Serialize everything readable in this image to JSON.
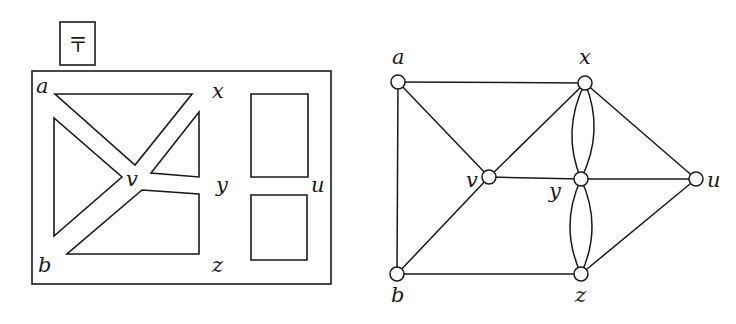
{
  "figure": {
    "left_panel": {
      "description": "Map of regions (faces) inside a bordered rectangle",
      "symbol_box": {
        "glyph": "〒",
        "x": 60,
        "y": 22,
        "w": 35,
        "h": 43
      },
      "border": {
        "x": 32,
        "y": 71,
        "w": 299,
        "h": 213
      },
      "labels": [
        {
          "id": "a",
          "text": "a",
          "x": 36,
          "y": 93
        },
        {
          "id": "x",
          "text": "x",
          "x": 212,
          "y": 98
        },
        {
          "id": "v",
          "text": "v",
          "x": 126,
          "y": 186
        },
        {
          "id": "y",
          "text": "y",
          "x": 216,
          "y": 192
        },
        {
          "id": "u",
          "text": "u",
          "x": 311,
          "y": 192
        },
        {
          "id": "b",
          "text": "b",
          "x": 38,
          "y": 272
        },
        {
          "id": "z",
          "text": "z",
          "x": 212,
          "y": 272
        }
      ],
      "regions": [
        {
          "id": "top-triangle",
          "points": "55,94 192,94 135,165"
        },
        {
          "id": "left-triangle",
          "points": "54,118 54,236 122,177"
        },
        {
          "id": "upper-right-triangle",
          "points": "199,112 199,177 151,173"
        },
        {
          "id": "bottom-quad",
          "points": "142,190 199,194 199,254 67,254"
        },
        {
          "id": "upper-rect",
          "points": "251,94 308,94 308,177 251,177"
        },
        {
          "id": "lower-rect",
          "points": "251,195 307,195 307,260 251,260"
        }
      ]
    },
    "right_panel": {
      "description": "Dual multigraph of the map",
      "nodes": [
        {
          "id": "a",
          "label": "a",
          "x": 398,
          "y": 82,
          "lx": 392,
          "ly": 64
        },
        {
          "id": "x",
          "label": "x",
          "x": 585,
          "y": 83,
          "lx": 579,
          "ly": 64
        },
        {
          "id": "v",
          "label": "v",
          "x": 489,
          "y": 177,
          "lx": 466,
          "ly": 187
        },
        {
          "id": "y",
          "label": "y",
          "x": 581,
          "y": 179,
          "lx": 549,
          "ly": 198
        },
        {
          "id": "u",
          "label": "u",
          "x": 696,
          "y": 179,
          "lx": 707,
          "ly": 187
        },
        {
          "id": "b",
          "label": "b",
          "x": 397,
          "y": 274,
          "lx": 391,
          "ly": 302
        },
        {
          "id": "z",
          "label": "z",
          "x": 581,
          "y": 274,
          "lx": 575,
          "ly": 302
        }
      ],
      "edges": [
        {
          "from": "a",
          "to": "x"
        },
        {
          "from": "a",
          "to": "b"
        },
        {
          "from": "a",
          "to": "v"
        },
        {
          "from": "v",
          "to": "x"
        },
        {
          "from": "v",
          "to": "b"
        },
        {
          "from": "v",
          "to": "y"
        },
        {
          "from": "y",
          "to": "u"
        },
        {
          "from": "x",
          "to": "u"
        },
        {
          "from": "z",
          "to": "u"
        },
        {
          "from": "b",
          "to": "z"
        }
      ],
      "multi_edges": [
        {
          "from": "x",
          "to": "y",
          "count": 2
        },
        {
          "from": "y",
          "to": "z",
          "count": 2
        }
      ]
    }
  }
}
